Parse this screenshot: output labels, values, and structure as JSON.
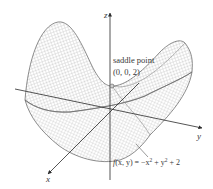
{
  "figure": {
    "type": "3d-surface",
    "surface_function": "f(x, y) = -x^2 + y^2 + 2",
    "axes": {
      "x_label": "x",
      "y_label": "y",
      "z_label": "z"
    },
    "annotation": {
      "title_line1": "saddle point",
      "title_line2": "(0, 0, 2)"
    },
    "formula": {
      "prefix": "f",
      "args": "(x, y) = −x",
      "exp1": "2",
      "mid": " + y",
      "exp2": "2",
      "suffix": " + 2"
    },
    "colors": {
      "axis": "#2a2a2a",
      "mesh": "#9a9a9a",
      "outline": "#707070",
      "text": "#3a3a3a"
    }
  }
}
